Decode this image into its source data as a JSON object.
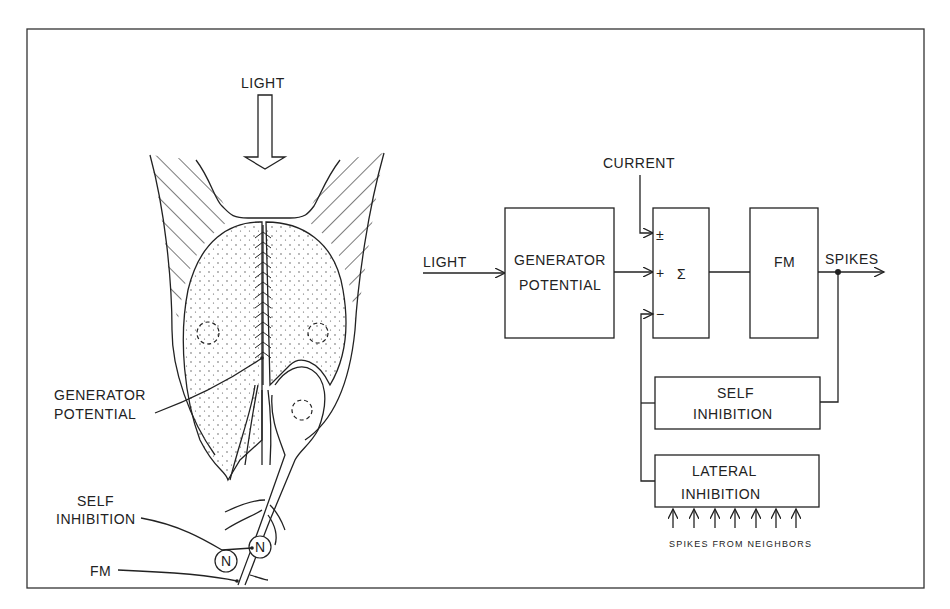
{
  "figure": {
    "left_panel": {
      "title": "Photoreceptor anatomy sketch",
      "labels": {
        "light": "LIGHT",
        "generator_potential_line1": "GENERATOR",
        "generator_potential_line2": "POTENTIAL",
        "self_inhibition_line1": "SELF",
        "self_inhibition_line2": "INHIBITION",
        "fm": "FM",
        "node_label": "N"
      }
    },
    "right_panel": {
      "inputs": {
        "light": "LIGHT",
        "current": "CURRENT"
      },
      "blocks": {
        "generator_line1": "GENERATOR",
        "generator_line2": "POTENTIAL",
        "sum_symbol": "Σ",
        "fm": "FM",
        "self_inhibition_line1": "SELF",
        "self_inhibition_line2": "INHIBITION",
        "lateral_inhibition_line1": "LATERAL",
        "lateral_inhibition_line2": "INHIBITION"
      },
      "sum_signs": {
        "current": "±",
        "generator": "+",
        "feedback": "−"
      },
      "output": "SPIKES",
      "neighbors_label": "SPIKES FROM NEIGHBORS",
      "neighbor_arrow_count": 7
    }
  }
}
